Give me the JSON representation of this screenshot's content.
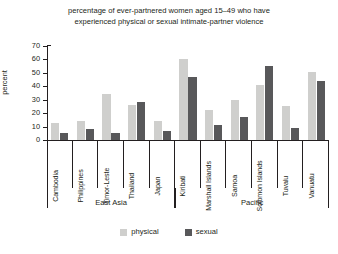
{
  "chart_data": {
    "type": "bar",
    "title": "percentage of ever-partnered women aged 15–49 who have experienced physical or sexual intimate-partner violence",
    "title_line1": "percentage of ever-partnered women aged 15–49 who have",
    "title_line2": "experienced physical or sexual intimate-partner violence",
    "xlabel": "",
    "ylabel": "percent",
    "ylim": [
      0,
      70
    ],
    "yticks": [
      0,
      10,
      20,
      30,
      40,
      50,
      60,
      70
    ],
    "ytick_labels": [
      "0",
      "10",
      "20",
      "30",
      "40",
      "50",
      "60",
      "70"
    ],
    "grid": false,
    "legend_position": "bottom-center",
    "categories": [
      "Cambodia",
      "Philippines",
      "Timor-Leste",
      "Thailand",
      "Japan",
      "Kiribati",
      "Marshall Islands",
      "Samoa",
      "Solomon Islands",
      "Tuvalu",
      "Vanuatu"
    ],
    "series": [
      {
        "name": "physical",
        "color": "#cfcfcd",
        "values": [
          13,
          14,
          34,
          26,
          14,
          60,
          22,
          30,
          41,
          25,
          51
        ]
      },
      {
        "name": "sexual",
        "color": "#58585a",
        "values": [
          5,
          8,
          5,
          28,
          7,
          47,
          11,
          17,
          55,
          9,
          44
        ]
      }
    ],
    "groups": [
      {
        "label": "East Asia",
        "categories": [
          "Cambodia",
          "Philippines",
          "Timor-Leste",
          "Thailand",
          "Japan"
        ]
      },
      {
        "label": "Pacific",
        "categories": [
          "Kiribati",
          "Marshall Islands",
          "Samoa",
          "Solomon Islands",
          "Tuvalu",
          "Vanuatu"
        ]
      }
    ]
  },
  "legend": {
    "items": [
      {
        "label": "physical",
        "color": "#cfcfcd"
      },
      {
        "label": "sexual",
        "color": "#58585a"
      }
    ]
  }
}
